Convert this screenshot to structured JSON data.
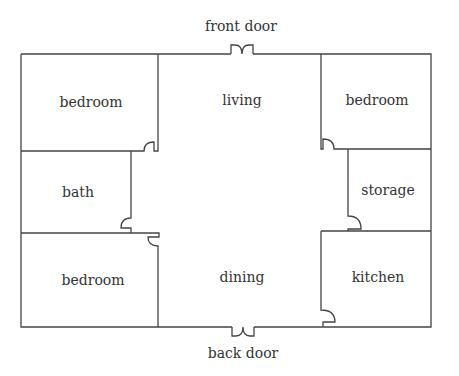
{
  "doors": {
    "front": "front door",
    "back": "back door"
  },
  "rooms": {
    "bedroom_nw": "bedroom",
    "living": "living",
    "bedroom_ne": "bedroom",
    "bath": "bath",
    "storage": "storage",
    "bedroom_sw": "bedroom",
    "dining": "dining",
    "kitchen": "kitchen"
  },
  "colors": {
    "wall": "#444444",
    "text": "#333333"
  }
}
